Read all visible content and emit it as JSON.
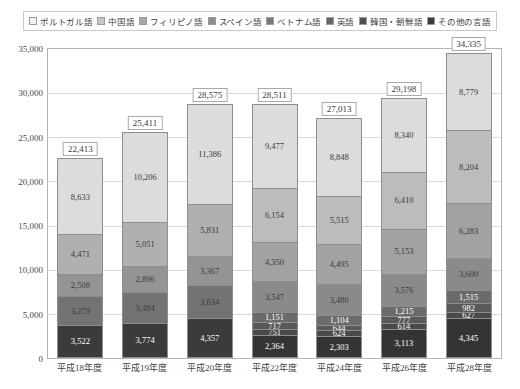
{
  "chart_data": {
    "type": "bar",
    "title": "",
    "xlabel": "",
    "ylabel": "",
    "ylim": [
      0,
      35000
    ],
    "yticks": [
      "0",
      "5,000",
      "10,000",
      "15,000",
      "20,000",
      "25,000",
      "30,000",
      "35,000"
    ],
    "ytick_values": [
      0,
      5000,
      10000,
      15000,
      20000,
      25000,
      30000,
      35000
    ],
    "grid": true,
    "stacked": true,
    "legend_position": "top",
    "categories": [
      "平成18年度",
      "平成19年度",
      "平成20年度",
      "平成22年度",
      "平成24年度",
      "平成26年度",
      "平成28年度"
    ],
    "series": [
      {
        "name": "ポルトガル語",
        "color": "#3b3b3b",
        "values": [
          3522,
          3774,
          4357,
          2364,
          2303,
          3113,
          4345
        ]
      },
      {
        "name": "中国語",
        "color": "#6e6e6e",
        "values": [
          3279,
          3484,
          3634,
          751,
          624,
          614,
          627
        ]
      },
      {
        "name": "フィリピノ語",
        "color": "#595959",
        "values": [
          2508,
          2896,
          3367,
          717,
          644,
          777,
          982
        ]
      },
      {
        "name": "スペイン語",
        "color": "#777777",
        "values": [
          null,
          null,
          null,
          1151,
          1104,
          1215,
          1515
        ]
      },
      {
        "name": "ベトナム語",
        "color": "#8c8c8c",
        "values": [
          null,
          null,
          null,
          3547,
          3480,
          3576,
          3600
        ]
      },
      {
        "name": "英語",
        "color": "#9e9e9e",
        "values": [
          4471,
          5051,
          5831,
          4350,
          4495,
          5153,
          6283
        ]
      },
      {
        "name": "韓国・朝鮮語",
        "color": "#b5b5b5",
        "values": [
          null,
          null,
          null,
          6154,
          5515,
          6410,
          8204
        ]
      },
      {
        "name": "その他の言語",
        "color": "#dcdcdc",
        "values": [
          8633,
          10206,
          11386,
          9477,
          8848,
          8340,
          8779
        ]
      }
    ],
    "totals": [
      22413,
      25411,
      28575,
      28511,
      27013,
      29198,
      34335
    ],
    "total_labels": [
      "22,413",
      "25,411",
      "28,575",
      "28,511",
      "27,013",
      "29,198",
      "34,335"
    ],
    "bars": [
      {
        "category": "平成18年度",
        "total_label": "22,413",
        "segments": [
          {
            "series": "その他の言語",
            "label": "8,633",
            "value": 8633,
            "color": "#dcdcdc",
            "text": "light"
          },
          {
            "series": "英語",
            "label": "4,471",
            "value": 4471,
            "color": "#b0b0b0",
            "text": "light"
          },
          {
            "series": "フィリピノ語",
            "label": "2,508",
            "value": 2508,
            "color": "#949494",
            "text": "light"
          },
          {
            "series": "中国語",
            "label": "3,279",
            "value": 3279,
            "color": "#737373",
            "text": "light"
          },
          {
            "series": "ポルトガル語",
            "label": "3,522",
            "value": 3522,
            "color": "#3b3b3b",
            "text": "dark"
          }
        ]
      },
      {
        "category": "平成19年度",
        "total_label": "25,411",
        "segments": [
          {
            "series": "その他の言語",
            "label": "10,206",
            "value": 10206,
            "color": "#dcdcdc",
            "text": "light"
          },
          {
            "series": "英語",
            "label": "5,051",
            "value": 5051,
            "color": "#b0b0b0",
            "text": "light"
          },
          {
            "series": "フィリピノ語",
            "label": "2,896",
            "value": 2896,
            "color": "#949494",
            "text": "light"
          },
          {
            "series": "中国語",
            "label": "3,484",
            "value": 3484,
            "color": "#737373",
            "text": "light"
          },
          {
            "series": "ポルトガル語",
            "label": "3,774",
            "value": 3774,
            "color": "#3b3b3b",
            "text": "dark"
          }
        ]
      },
      {
        "category": "平成20年度",
        "total_label": "28,575",
        "segments": [
          {
            "series": "その他の言語",
            "label": "11,386",
            "value": 11386,
            "color": "#dcdcdc",
            "text": "light"
          },
          {
            "series": "英語",
            "label": "5,831",
            "value": 5831,
            "color": "#b0b0b0",
            "text": "light"
          },
          {
            "series": "フィリピノ語",
            "label": "3,367",
            "value": 3367,
            "color": "#949494",
            "text": "light"
          },
          {
            "series": "中国語",
            "label": "3,634",
            "value": 3634,
            "color": "#737373",
            "text": "light"
          },
          {
            "series": "ポルトガル語",
            "label": "4,357",
            "value": 4357,
            "color": "#3b3b3b",
            "text": "dark"
          }
        ]
      },
      {
        "category": "平成22年度",
        "total_label": "28,511",
        "segments": [
          {
            "series": "その他の言語",
            "label": "9,477",
            "value": 9477,
            "color": "#dcdcdc",
            "text": "light"
          },
          {
            "series": "韓国・朝鮮語",
            "label": "6,154",
            "value": 6154,
            "color": "#bcbcbc",
            "text": "light"
          },
          {
            "series": "英語",
            "label": "4,350",
            "value": 4350,
            "color": "#a2a2a2",
            "text": "light"
          },
          {
            "series": "ベトナム語",
            "label": "3,547",
            "value": 3547,
            "color": "#8a8a8a",
            "text": "light"
          },
          {
            "series": "スペイン語",
            "label": "1,151",
            "value": 1151,
            "color": "#6b6b6b",
            "text": "dark"
          },
          {
            "series": "フィリピノ語",
            "label": "717",
            "value": 717,
            "color": "#595959",
            "text": "dark"
          },
          {
            "series": "中国語",
            "label": "751",
            "value": 751,
            "color": "#4a4a4a",
            "text": "dark"
          },
          {
            "series": "ポルトガル語",
            "label": "2,364",
            "value": 2364,
            "color": "#343434",
            "text": "dark"
          }
        ]
      },
      {
        "category": "平成24年度",
        "total_label": "27,013",
        "segments": [
          {
            "series": "その他の言語",
            "label": "8,848",
            "value": 8848,
            "color": "#dcdcdc",
            "text": "light"
          },
          {
            "series": "韓国・朝鮮語",
            "label": "5,515",
            "value": 5515,
            "color": "#bcbcbc",
            "text": "light"
          },
          {
            "series": "英語",
            "label": "4,495",
            "value": 4495,
            "color": "#a2a2a2",
            "text": "light"
          },
          {
            "series": "ベトナム語",
            "label": "3,480",
            "value": 3480,
            "color": "#8a8a8a",
            "text": "light"
          },
          {
            "series": "スペイン語",
            "label": "1,104",
            "value": 1104,
            "color": "#6b6b6b",
            "text": "dark"
          },
          {
            "series": "フィリピノ語",
            "label": "644",
            "value": 644,
            "color": "#595959",
            "text": "dark"
          },
          {
            "series": "中国語",
            "label": "624",
            "value": 624,
            "color": "#4a4a4a",
            "text": "dark"
          },
          {
            "series": "ポルトガル語",
            "label": "2,303",
            "value": 2303,
            "color": "#343434",
            "text": "dark"
          }
        ]
      },
      {
        "category": "平成26年度",
        "total_label": "29,198",
        "segments": [
          {
            "series": "その他の言語",
            "label": "8,340",
            "value": 8340,
            "color": "#dcdcdc",
            "text": "light"
          },
          {
            "series": "韓国・朝鮮語",
            "label": "6,410",
            "value": 6410,
            "color": "#bcbcbc",
            "text": "light"
          },
          {
            "series": "英語",
            "label": "5,153",
            "value": 5153,
            "color": "#a2a2a2",
            "text": "light"
          },
          {
            "series": "ベトナム語",
            "label": "3,576",
            "value": 3576,
            "color": "#8a8a8a",
            "text": "light"
          },
          {
            "series": "スペイン語",
            "label": "1,215",
            "value": 1215,
            "color": "#6b6b6b",
            "text": "dark"
          },
          {
            "series": "フィリピノ語",
            "label": "777",
            "value": 777,
            "color": "#595959",
            "text": "dark"
          },
          {
            "series": "中国語",
            "label": "614",
            "value": 614,
            "color": "#4a4a4a",
            "text": "dark"
          },
          {
            "series": "ポルトガル語",
            "label": "3,113",
            "value": 3113,
            "color": "#343434",
            "text": "dark"
          }
        ]
      },
      {
        "category": "平成28年度",
        "total_label": "34,335",
        "segments": [
          {
            "series": "その他の言語",
            "label": "8,779",
            "value": 8779,
            "color": "#dcdcdc",
            "text": "light"
          },
          {
            "series": "韓国・朝鮮語",
            "label": "8,204",
            "value": 8204,
            "color": "#bcbcbc",
            "text": "light"
          },
          {
            "series": "英語",
            "label": "6,283",
            "value": 6283,
            "color": "#a2a2a2",
            "text": "light"
          },
          {
            "series": "ベトナム語",
            "label": "3,600",
            "value": 3600,
            "color": "#8a8a8a",
            "text": "light"
          },
          {
            "series": "スペイン語",
            "label": "1,515",
            "value": 1515,
            "color": "#6b6b6b",
            "text": "dark"
          },
          {
            "series": "フィリピノ語",
            "label": "982",
            "value": 982,
            "color": "#595959",
            "text": "dark"
          },
          {
            "series": "中国語",
            "label": "627",
            "value": 627,
            "color": "#4a4a4a",
            "text": "dark"
          },
          {
            "series": "ポルトガル語",
            "label": "4,345",
            "value": 4345,
            "color": "#343434",
            "text": "dark"
          }
        ]
      }
    ],
    "legend": [
      {
        "label": "ポルトガル語",
        "color": "#f2f2f2"
      },
      {
        "label": "中国語",
        "color": "#c6c6c6"
      },
      {
        "label": "フィリピノ語",
        "color": "#a8a8a8"
      },
      {
        "label": "スペイン語",
        "color": "#8f8f8f"
      },
      {
        "label": "ベトナム語",
        "color": "#787878"
      },
      {
        "label": "英語",
        "color": "#666666"
      },
      {
        "label": "韓国・朝鮮語",
        "color": "#4f4f4f"
      },
      {
        "label": "その他の言語",
        "color": "#3a3a3a"
      }
    ]
  }
}
